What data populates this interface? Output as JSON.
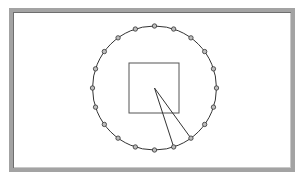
{
  "diagram": {
    "frame": {
      "x": 9,
      "y": 8,
      "width": 286,
      "height": 164,
      "border_color": "#a3a3a3"
    },
    "circle": {
      "cx": 154.5,
      "cy": 88,
      "r": 62,
      "stroke": "#333333"
    },
    "nodes": {
      "count": 20,
      "radius": 2.2,
      "fill": "#bdbdbd",
      "stroke": "#333333"
    },
    "square": {
      "x": 129,
      "y": 63,
      "width": 50,
      "height": 50,
      "stroke": "#555555"
    },
    "triangle": {
      "apex": [
        154.5,
        88
      ],
      "points": [
        [
          173.7,
          147
        ],
        [
          190.9,
          138.2
        ]
      ],
      "stroke": "#333333"
    }
  }
}
